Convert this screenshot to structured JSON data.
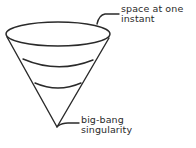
{
  "diagram": {
    "colors": {
      "stroke": "#2a2a2a",
      "background": "#ffffff"
    },
    "labels": {
      "top": {
        "line1": "space at one",
        "line2": "instant"
      },
      "bottom": {
        "line1": "big-bang",
        "line2": "singularity"
      }
    },
    "shapes": {
      "top_ellipse": {
        "cx": 58,
        "cy": 34,
        "rx": 52,
        "ry": 12
      },
      "apex": {
        "x": 57,
        "y": 127
      },
      "cross_sections": [
        {
          "name": "middle-slice",
          "y": 64
        },
        {
          "name": "lower-slice",
          "y": 89
        }
      ]
    }
  }
}
